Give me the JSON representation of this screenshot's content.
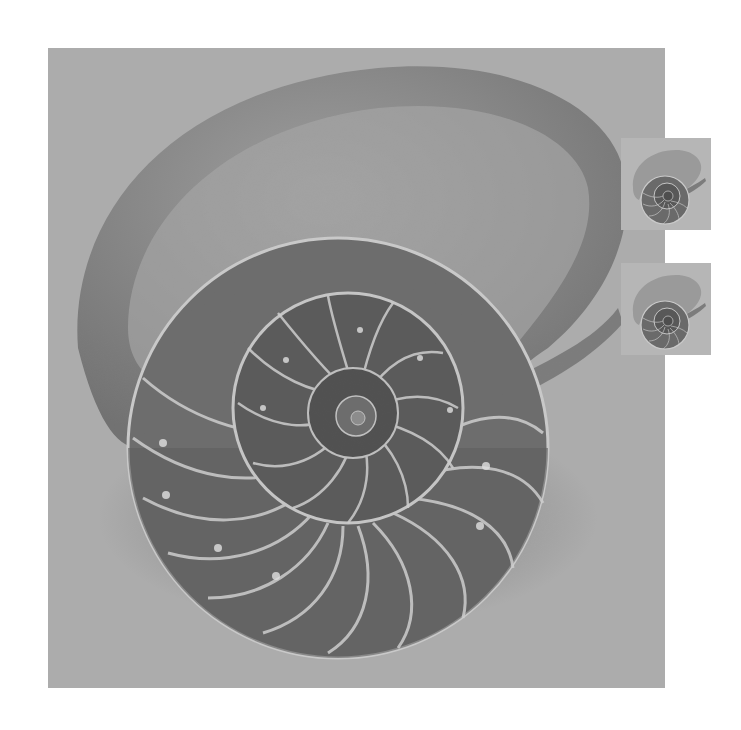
{
  "image": {
    "subject": "sectioned nautilus shell",
    "palette": {
      "background": "#a9a9a9",
      "shell_outer": "#8e8e8e",
      "shell_inner_dark": "#5e5e5e",
      "chamber_wall": "#cfcfcf",
      "page": "#ffffff"
    }
  },
  "thumbnails": [
    {
      "label": "nautilus-thumbnail-1"
    },
    {
      "label": "nautilus-thumbnail-2"
    }
  ]
}
